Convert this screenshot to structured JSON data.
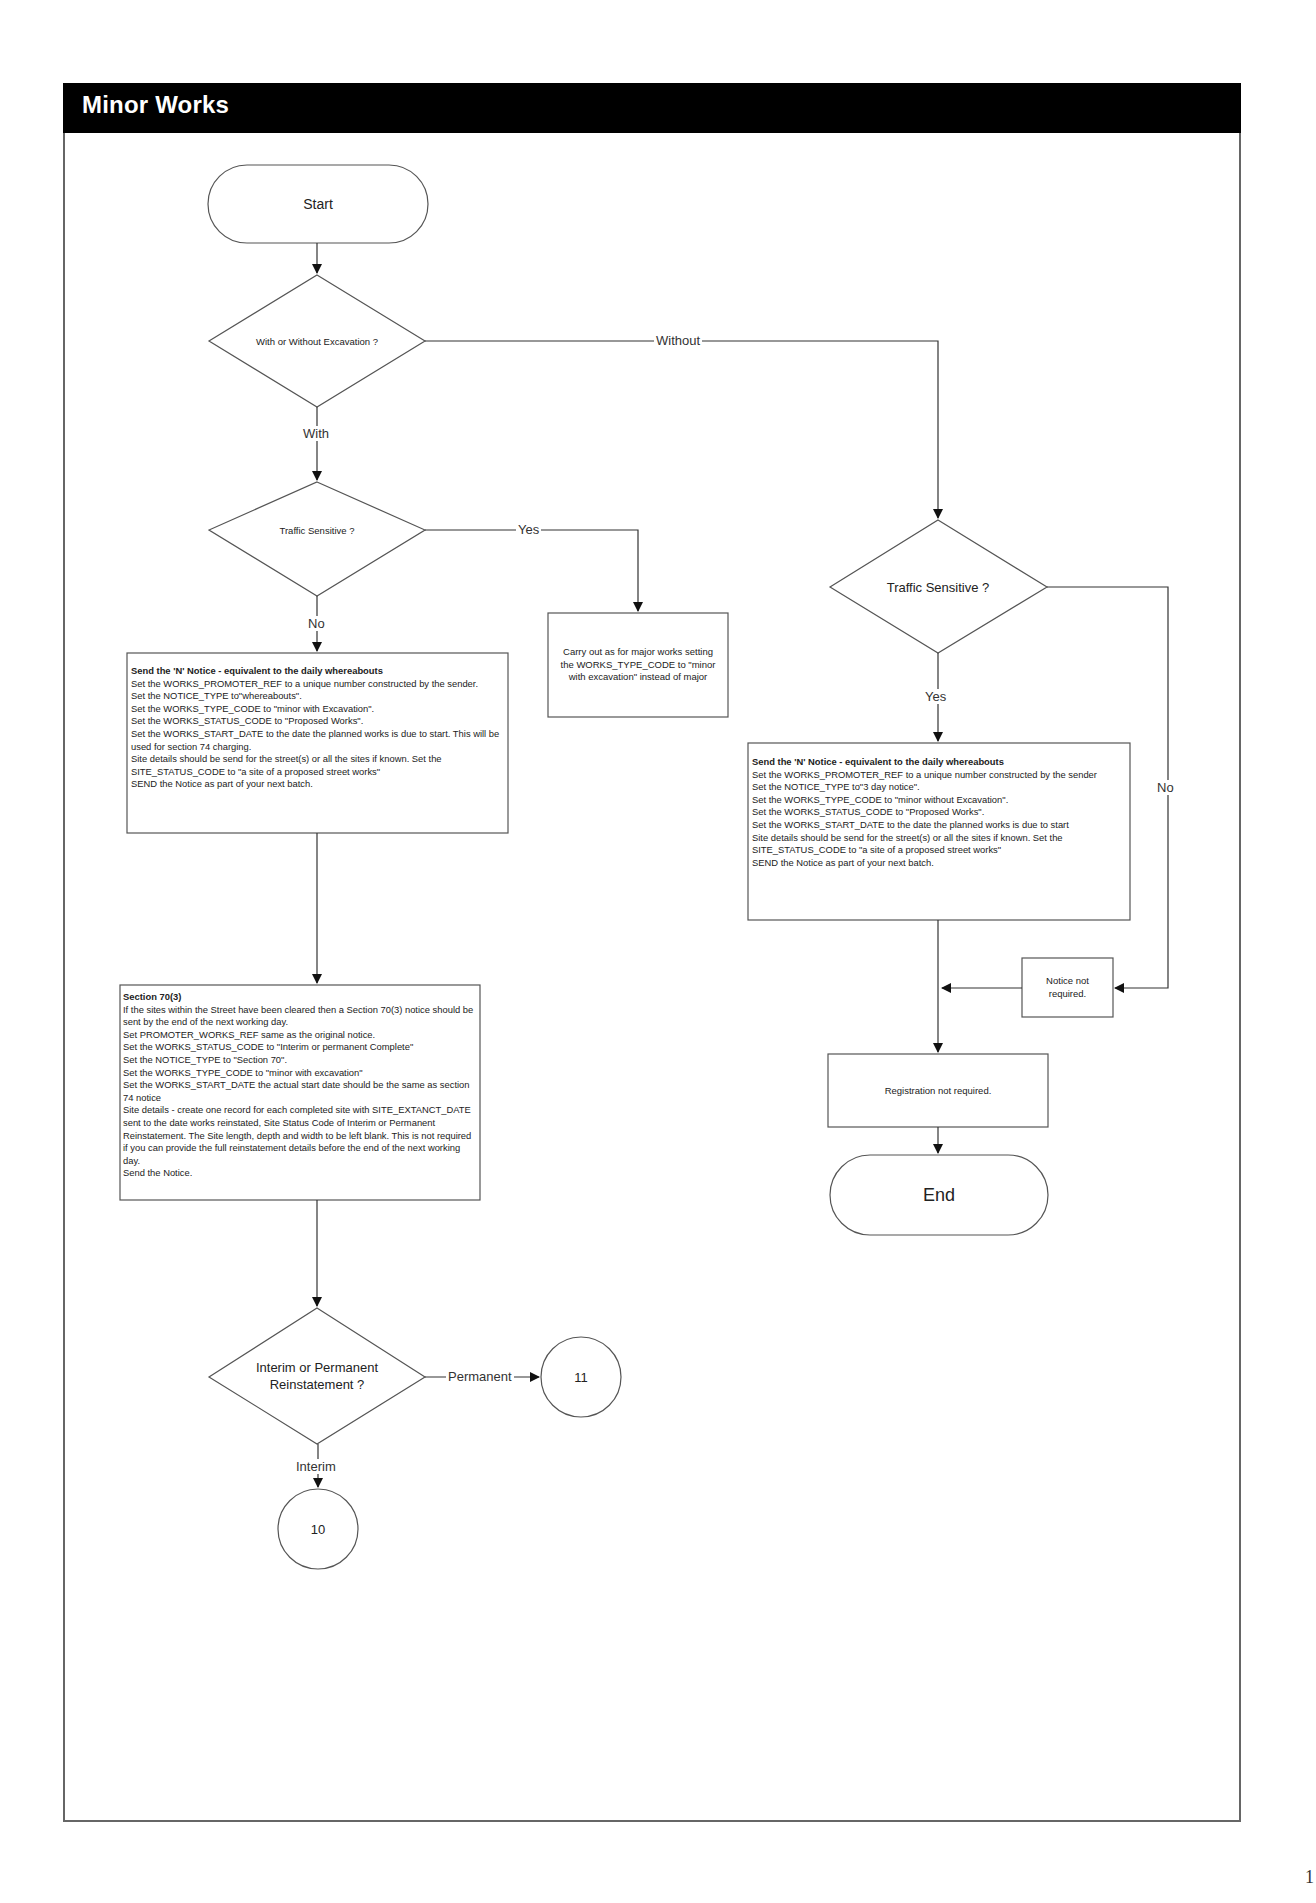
{
  "header": {
    "title": "Minor Works"
  },
  "flowchart": {
    "start": {
      "label": "Start"
    },
    "end": {
      "label": "End"
    },
    "decisions": {
      "excavation": {
        "label": "With or Without Excavation ?"
      },
      "traffic_with": {
        "label": "Traffic Sensitive ?"
      },
      "traffic_without": {
        "label": "Traffic Sensitive ?"
      },
      "reinstatement": {
        "label": "Interim or Permanent Reinstatement ?"
      }
    },
    "edges": {
      "without": "Without",
      "with": "With",
      "yes_left": "Yes",
      "no_left": "No",
      "yes_right": "Yes",
      "no_right": "No",
      "permanent": "Permanent",
      "interim": "Interim"
    },
    "boxes": {
      "major_works": {
        "text": "Carry out as for major works setting the WORKS_TYPE_CODE to \"minor with excavation\" instead of major"
      },
      "n_notice_with": {
        "title": "Send the 'N' Notice - equivalent to the daily whereabouts",
        "lines": [
          "Set the WORKS_PROMOTER_REF to a unique number constructed by the sender.",
          "Set the NOTICE_TYPE to\"whereabouts\".",
          "Set the WORKS_TYPE_CODE to \"minor with Excavation\".",
          "Set the WORKS_STATUS_CODE to \"Proposed Works\".",
          "Set the WORKS_START_DATE to the date the planned works is due to start.  This will be used for section 74 charging.",
          "Site details should be send for the street(s) or all the sites if known.  Set the SITE_STATUS_CODE to \"a site of a proposed street works\"",
          "SEND the Notice as part of your next batch."
        ]
      },
      "n_notice_without": {
        "title": "Send the 'N' Notice - equivalent to the daily whereabouts",
        "lines": [
          "Set the WORKS_PROMOTER_REF to a unique number constructed by the sender",
          "Set the NOTICE_TYPE to\"3 day notice\".",
          "Set the WORKS_TYPE_CODE to \"minor without Excavation\".",
          "Set the WORKS_STATUS_CODE to \"Proposed Works\".",
          "Set the WORKS_START_DATE to the date the planned works is due to start",
          "Site details should be send for the street(s) or all the sites if known.  Set the SITE_STATUS_CODE to \"a site of a proposed street works\"",
          "SEND the Notice as part of your next batch."
        ]
      },
      "section_70": {
        "title": "Section 70(3)",
        "lines": [
          "If the sites within the Street have been cleared then a Section 70(3) notice should be sent by the end of the next working day.",
          "Set PROMOTER_WORKS_REF same as the original notice.",
          "Set the WORKS_STATUS_CODE to \"Interim or permanent Complete\"",
          "Set the NOTICE_TYPE to \"Section 70\".",
          "Set the WORKS_TYPE_CODE to \"minor with excavation\"",
          "Set the WORKS_START_DATE the actual start date should be the same as section 74 notice",
          "Site details - create one record for each completed site with SITE_EXTANCT_DATE sent to the date works reinstated, Site Status Code of Interim or Permanent Reinstatement.  The Site length, depth and width to be left blank. This is not required if you can provide the full reinstatement details before the end of the next working day.",
          "Send the Notice."
        ]
      },
      "notice_not_required": {
        "text": "Notice not required."
      },
      "registration_not_required": {
        "text": "Registration not required."
      }
    },
    "connectors": {
      "to_10": {
        "label": "10"
      },
      "to_11": {
        "label": "11"
      }
    }
  },
  "page": {
    "number": "1"
  }
}
